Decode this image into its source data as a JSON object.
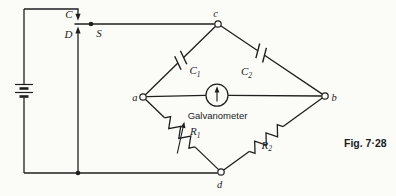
{
  "figure": {
    "caption": "Fig. 7·28",
    "galvanometer_label": "Galvanometer",
    "switch": {
      "contact_top": "C",
      "contact_bottom": "D",
      "arm": "S"
    },
    "nodes": {
      "a": "a",
      "b": "b",
      "c": "c",
      "d": "d"
    },
    "capacitors": {
      "c1": {
        "base": "C",
        "sub": "1"
      },
      "c2": {
        "base": "C",
        "sub": "2"
      }
    },
    "resistors": {
      "r1": {
        "base": "R",
        "sub": "1"
      },
      "r2": {
        "base": "R",
        "sub": "2"
      }
    },
    "colors": {
      "ink": "#1f1f1f",
      "paper": "#fbfbf8"
    }
  }
}
